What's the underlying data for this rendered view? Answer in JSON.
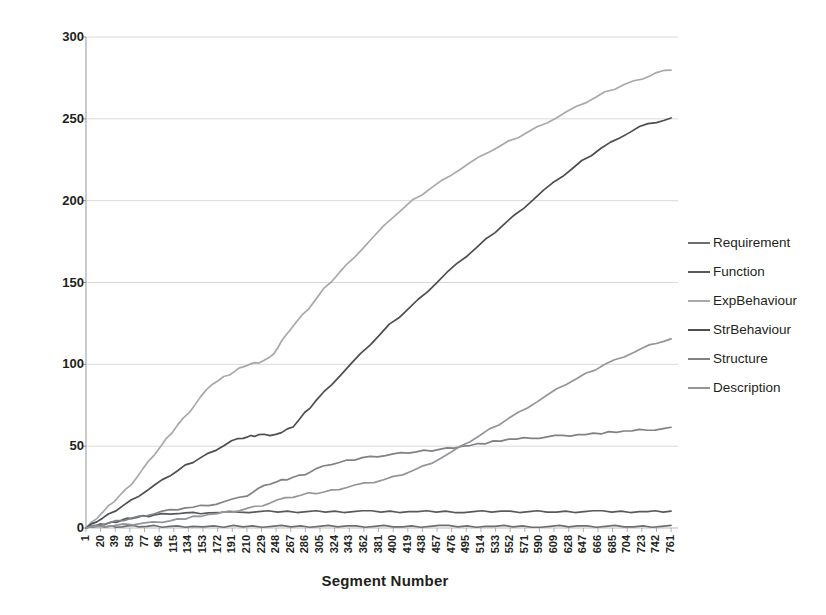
{
  "chart_data": {
    "type": "line",
    "title": "",
    "xlabel": "Segment Number",
    "ylabel": "Cumulative Occurance",
    "xlim": [
      1,
      770
    ],
    "ylim": [
      0,
      300
    ],
    "yticks": [
      0,
      50,
      100,
      150,
      200,
      250,
      300
    ],
    "ytick_labels": [
      "0",
      "50",
      "100",
      "150",
      "200",
      "250",
      "300"
    ],
    "grid": "horizontal",
    "legend_position": "right",
    "xtick_labels": [
      "1",
      "20",
      "39",
      "58",
      "77",
      "96",
      "115",
      "134",
      "153",
      "172",
      "191",
      "210",
      "229",
      "248",
      "267",
      "286",
      "305",
      "324",
      "343",
      "362",
      "381",
      "400",
      "419",
      "438",
      "457",
      "476",
      "495",
      "514",
      "533",
      "552",
      "571",
      "590",
      "609",
      "628",
      "647",
      "666",
      "685",
      "704",
      "723",
      "742",
      "761"
    ],
    "series": [
      {
        "name": "Requirement",
        "color": "#6d6e71",
        "x": [
          1,
          10,
          20,
          30,
          40,
          55,
          70,
          90,
          110,
          140,
          180,
          230,
          280,
          340,
          400,
          460,
          520,
          580,
          640,
          700,
          761
        ],
        "values": [
          0,
          1,
          1,
          1,
          1,
          1,
          1,
          1,
          1,
          1,
          1,
          1,
          1,
          1,
          1,
          1,
          1,
          1,
          1,
          1,
          1
        ]
      },
      {
        "name": "Function",
        "color": "#58595b",
        "x": [
          1,
          10,
          20,
          30,
          40,
          50,
          60,
          75,
          90,
          110,
          130,
          160,
          200,
          250,
          300,
          360,
          420,
          480,
          540,
          600,
          660,
          720,
          761
        ],
        "values": [
          0,
          1,
          2,
          3,
          4,
          5,
          6,
          7,
          8,
          9,
          9,
          9,
          10,
          10,
          10,
          10,
          10,
          10,
          10,
          10,
          10,
          10,
          10
        ]
      },
      {
        "name": "ExpBehaviour",
        "color": "#a7a9ac",
        "x": [
          1,
          15,
          30,
          45,
          60,
          75,
          90,
          105,
          120,
          135,
          150,
          165,
          180,
          195,
          205,
          215,
          225,
          240,
          250,
          260,
          275,
          290,
          310,
          330,
          350,
          375,
          400,
          425,
          450,
          475,
          500,
          525,
          550,
          575,
          600,
          625,
          650,
          675,
          700,
          725,
          742,
          761
        ],
        "values": [
          0,
          6,
          13,
          20,
          27,
          36,
          45,
          54,
          63,
          71,
          80,
          88,
          92,
          96,
          99,
          100,
          101,
          104,
          110,
          118,
          126,
          134,
          146,
          156,
          166,
          178,
          190,
          200,
          208,
          216,
          223,
          230,
          236,
          242,
          248,
          254,
          260,
          266,
          271,
          275,
          278,
          280
        ]
      },
      {
        "name": "StrBehaviour",
        "color": "#4d4e50",
        "x": [
          1,
          15,
          30,
          50,
          70,
          90,
          110,
          130,
          150,
          170,
          190,
          205,
          215,
          225,
          240,
          255,
          270,
          285,
          300,
          320,
          345,
          370,
          395,
          420,
          445,
          470,
          495,
          520,
          545,
          570,
          595,
          620,
          645,
          670,
          695,
          720,
          742,
          761
        ],
        "values": [
          0,
          4,
          8,
          14,
          20,
          26,
          32,
          38,
          43,
          48,
          53,
          55,
          56,
          57,
          57,
          58,
          62,
          70,
          78,
          88,
          100,
          112,
          124,
          134,
          145,
          156,
          166,
          176,
          186,
          196,
          206,
          215,
          224,
          232,
          239,
          245,
          248,
          250
        ]
      },
      {
        "name": "Structure",
        "color": "#808285",
        "x": [
          1,
          20,
          40,
          60,
          80,
          100,
          130,
          160,
          190,
          210,
          225,
          240,
          255,
          270,
          285,
          300,
          320,
          340,
          360,
          380,
          400,
          420,
          440,
          460,
          490,
          520,
          550,
          580,
          610,
          640,
          670,
          700,
          730,
          761
        ],
        "values": [
          0,
          2,
          4,
          6,
          8,
          10,
          12,
          14,
          17,
          20,
          24,
          27,
          29,
          31,
          33,
          36,
          39,
          41,
          43,
          44,
          45,
          46,
          47,
          48,
          50,
          52,
          54,
          55,
          56,
          57,
          58,
          59,
          60,
          61
        ]
      },
      {
        "name": "Description",
        "color": "#939598",
        "x": [
          1,
          25,
          50,
          75,
          100,
          130,
          160,
          190,
          210,
          230,
          250,
          270,
          290,
          310,
          330,
          350,
          375,
          400,
          425,
          450,
          475,
          500,
          525,
          550,
          575,
          600,
          625,
          650,
          675,
          700,
          725,
          742,
          761
        ],
        "values": [
          0,
          1,
          2,
          3,
          4,
          6,
          8,
          10,
          12,
          14,
          17,
          19,
          21,
          22,
          24,
          26,
          28,
          31,
          35,
          40,
          46,
          53,
          60,
          67,
          74,
          81,
          88,
          94,
          100,
          105,
          110,
          113,
          115
        ]
      }
    ]
  },
  "legend": {
    "items": [
      {
        "label": "Requirement"
      },
      {
        "label": "Function"
      },
      {
        "label": "ExpBehaviour"
      },
      {
        "label": "StrBehaviour"
      },
      {
        "label": "Structure"
      },
      {
        "label": "Description"
      }
    ]
  }
}
